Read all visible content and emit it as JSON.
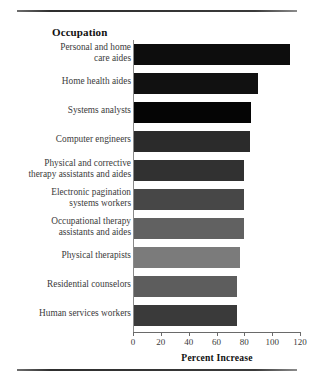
{
  "figure": {
    "heading": "Occupation",
    "axis_title": "Percent Increase",
    "top_rule": "horizontal-rule",
    "bottom_rule": "horizontal-rule"
  },
  "chart_data": {
    "type": "bar",
    "orientation": "horizontal",
    "title": "Occupation",
    "xlabel": "Percent Increase",
    "ylabel": "Occupation",
    "xlim": [
      0,
      120
    ],
    "xticks": [
      0,
      20,
      40,
      60,
      80,
      100,
      120
    ],
    "grid": false,
    "legend": false,
    "categories": [
      "Personal and home care aides",
      "Home health aides",
      "Systems analysts",
      "Computer engineers",
      "Physical and corrective therapy assistants and aides",
      "Electronic pagination systems workers",
      "Occupational therapy assistants and aides",
      "Physical therapists",
      "Residential counselors",
      "Human services workers"
    ],
    "values": [
      112,
      89,
      84,
      83,
      79,
      79,
      79,
      76,
      74,
      74
    ],
    "bar_colors": [
      "#0d0d0d",
      "#111111",
      "#050505",
      "#2b2b2b",
      "#313131",
      "#474747",
      "#616161",
      "#7b7b7b",
      "#5d5d5d",
      "#3a3a3a"
    ]
  },
  "rows": [
    {
      "label_line1": "Personal and home",
      "label_line2": "care aides",
      "value": 112,
      "color": "#0d0d0d"
    },
    {
      "label_line1": "Home health aides",
      "label_line2": "",
      "value": 89,
      "color": "#111111"
    },
    {
      "label_line1": "Systems analysts",
      "label_line2": "",
      "value": 84,
      "color": "#050505"
    },
    {
      "label_line1": "Computer engineers",
      "label_line2": "",
      "value": 83,
      "color": "#2b2b2b"
    },
    {
      "label_line1": "Physical and corrective",
      "label_line2": "therapy assistants and aides",
      "value": 79,
      "color": "#313131"
    },
    {
      "label_line1": "Electronic pagination",
      "label_line2": "systems workers",
      "value": 79,
      "color": "#474747"
    },
    {
      "label_line1": "Occupational therapy",
      "label_line2": "assistants and aides",
      "value": 79,
      "color": "#616161"
    },
    {
      "label_line1": "Physical therapists",
      "label_line2": "",
      "value": 76,
      "color": "#7b7b7b"
    },
    {
      "label_line1": "Residential counselors",
      "label_line2": "",
      "value": 74,
      "color": "#5d5d5d"
    },
    {
      "label_line1": "Human services workers",
      "label_line2": "",
      "value": 74,
      "color": "#3a3a3a"
    }
  ],
  "ticks": [
    {
      "label": "0"
    },
    {
      "label": "20"
    },
    {
      "label": "40"
    },
    {
      "label": "60"
    },
    {
      "label": "80"
    },
    {
      "label": "100"
    },
    {
      "label": "120"
    }
  ]
}
